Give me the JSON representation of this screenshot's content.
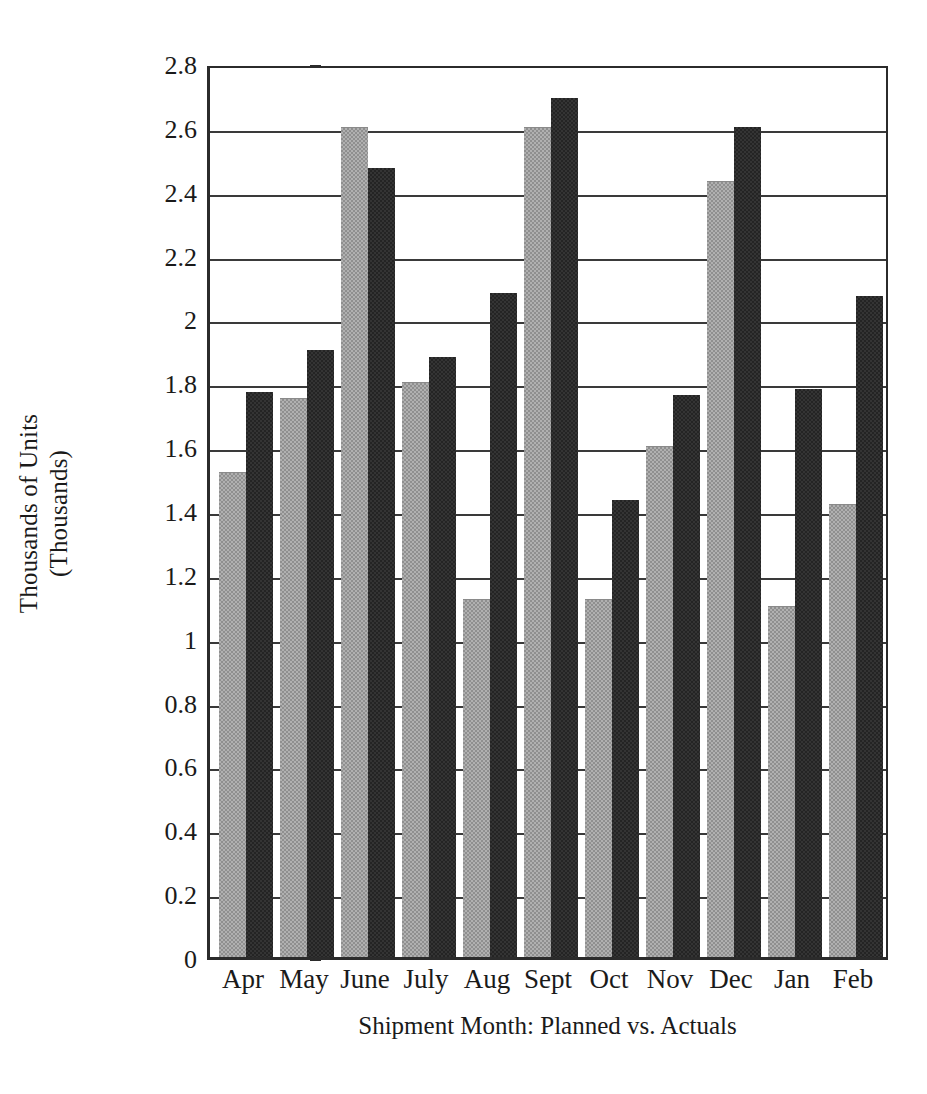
{
  "chart_data": {
    "type": "bar",
    "title": "",
    "xlabel": "Shipment Month: Planned vs. Actuals",
    "ylabel": "Thousands of Units",
    "ylabel_line2": "(Thousands)",
    "categories": [
      "Apr",
      "May",
      "June",
      "July",
      "Aug",
      "Sept",
      "Oct",
      "Nov",
      "Dec",
      "Jan",
      "Feb"
    ],
    "series": [
      {
        "name": "Planned",
        "color": "#b0b0b0",
        "values": [
          1.52,
          1.75,
          2.6,
          1.8,
          1.12,
          2.6,
          1.12,
          1.6,
          2.43,
          1.1,
          1.42
        ]
      },
      {
        "name": "Actuals",
        "color": "#242424",
        "values": [
          1.77,
          1.9,
          2.47,
          1.88,
          2.08,
          2.69,
          1.43,
          1.76,
          2.6,
          1.78,
          2.07
        ]
      }
    ],
    "ylim": [
      0,
      2.8
    ],
    "ytick_labels": [
      "0",
      "0.2",
      "0.4",
      "0.6",
      "0.8",
      "1",
      "1.2",
      "1.4",
      "1.6",
      "1.8",
      "2",
      "2.2",
      "2.4",
      "2.6",
      "2.8"
    ],
    "ytick_values": [
      0,
      0.2,
      0.4,
      0.6,
      0.8,
      1,
      1.2,
      1.4,
      1.6,
      1.8,
      2,
      2.2,
      2.4,
      2.6,
      2.8
    ],
    "grid": true,
    "legend_position": "none"
  }
}
